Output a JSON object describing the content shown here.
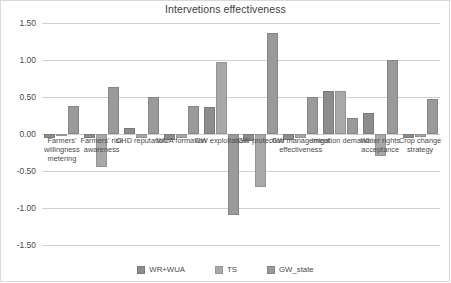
{
  "chart_data": {
    "type": "bar",
    "title": "Intervetions effectiveness",
    "xlabel": "",
    "ylabel": "",
    "ylim": [
      -1.5,
      1.5
    ],
    "yticks": [
      1.5,
      1.0,
      0.5,
      0.0,
      -0.5,
      -1.0,
      -1.5
    ],
    "ytick_labels": [
      "1.50",
      "1.00",
      "0.50",
      "0.00",
      "-0.50",
      "-1.00",
      "-1.50"
    ],
    "grid": true,
    "legend_position": "bottom",
    "categories": [
      "Farmers' willingness metering",
      "Farmers' risk awareness",
      "CHD reputation",
      "WUA formation",
      "GW exploitation",
      "GW protection",
      "GW management effectiveness",
      "Irrigation demand",
      "Water rights acceptance",
      "Crop change strategy"
    ],
    "series": [
      {
        "name": "WR+WUA",
        "color": "#8d8d8d",
        "values": [
          -0.05,
          -0.05,
          0.08,
          -0.08,
          0.36,
          -0.1,
          -0.08,
          0.58,
          0.28,
          -0.05
        ]
      },
      {
        "name": "TS",
        "color": "#a8a8a8",
        "values": [
          -0.03,
          -0.45,
          -0.05,
          -0.05,
          0.97,
          -0.71,
          -0.05,
          0.58,
          -0.3,
          -0.04
        ]
      },
      {
        "name": "GW_state",
        "color": "#9a9a9a",
        "values": [
          0.38,
          0.64,
          0.5,
          0.38,
          -1.1,
          1.36,
          0.5,
          0.22,
          1.0,
          0.47
        ]
      }
    ]
  }
}
